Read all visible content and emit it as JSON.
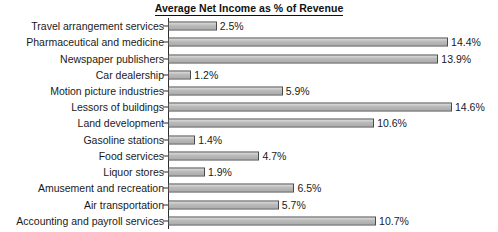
{
  "chart_data": {
    "type": "bar",
    "orientation": "horizontal",
    "title": "Average Net Income as % of Revenue",
    "xlabel": "",
    "ylabel": "",
    "xlim": [
      0,
      14.6
    ],
    "grid": false,
    "legend": null,
    "value_suffix": "%",
    "categories": [
      "Travel arrangement services",
      "Pharmaceutical and medicine",
      "Newspaper publishers",
      "Car dealership",
      "Motion picture industries",
      "Lessors of buildings",
      "Land development",
      "Gasoline stations",
      "Food services",
      "Liquor stores",
      "Amusement and recreation",
      "Air transportation",
      "Accounting and payroll services"
    ],
    "values": [
      2.5,
      14.4,
      13.9,
      1.2,
      5.9,
      14.6,
      10.6,
      1.4,
      4.7,
      1.9,
      6.5,
      5.7,
      10.7
    ],
    "value_labels": [
      "2.5%",
      "14.4%",
      "13.9%",
      "1.2%",
      "5.9%",
      "14.6%",
      "10.6%",
      "1.4%",
      "4.7%",
      "1.9%",
      "6.5%",
      "5.7%",
      "10.7%"
    ],
    "colors": {
      "bar_fill": "#b8b8b8",
      "bar_border": "#4a4a4a",
      "axis": "#2b2b2b",
      "text": "#1a1a1a",
      "background": "#ffffff"
    }
  }
}
